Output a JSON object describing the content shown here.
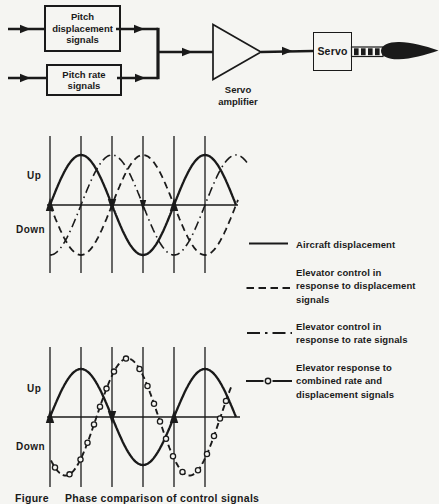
{
  "figure": {
    "colors": {
      "ink": "#1a1a1a",
      "paper": "#f5f5f2"
    },
    "block_diagram": {
      "displacement_box": "Pitch\ndisplacement\nsignals",
      "rate_box": "Pitch rate\nsignals",
      "amplifier_label": "Servo\namplifier",
      "servo_box": "Servo"
    },
    "upper_plot": {
      "up_label": "Up",
      "down_label": "Down"
    },
    "lower_plot": {
      "up_label": "Up",
      "down_label": "Down"
    },
    "legend": {
      "items": [
        {
          "style": "solid",
          "label": "Aircraft displacement"
        },
        {
          "style": "dashed",
          "label": "Elevator control in\nresponse to displacement\nsignals"
        },
        {
          "style": "dash-dot",
          "label": "Elevator control in\nresponse to rate signals"
        },
        {
          "style": "circle-dashed",
          "label": "Elevator response to\ncombined rate and\ndisplacement signals"
        }
      ]
    },
    "caption_fragment": "Figure     Phase comparison of control signals"
  },
  "chart_data": [
    {
      "type": "line",
      "title": "Upper waveform plot: aircraft displacement and elevator control signals vs time",
      "xlabel": "time (no scale shown)",
      "ylabel": "Up / Down",
      "y_tick_labels": [
        "Up",
        "Down"
      ],
      "gridlines": {
        "vertical_count": 6,
        "spacing": "quarter period",
        "horizontal": false
      },
      "x_range_cycles": [
        0,
        1.5
      ],
      "series": [
        {
          "name": "Aircraft displacement",
          "line_style": "solid",
          "waveform": "sine",
          "amplitude": 1.0,
          "phase_deg": 0
        },
        {
          "name": "Elevator control in response to displacement signals",
          "line_style": "dashed",
          "waveform": "sine",
          "amplitude": 1.0,
          "phase_deg": 180
        },
        {
          "name": "Elevator control in response to rate signals",
          "line_style": "dash-dot",
          "waveform": "sine",
          "amplitude": 1.0,
          "phase_deg": -90
        }
      ]
    },
    {
      "type": "line",
      "title": "Lower waveform plot: aircraft displacement and combined elevator response vs time",
      "xlabel": "time (no scale shown)",
      "ylabel": "Up / Down",
      "y_tick_labels": [
        "Up",
        "Down"
      ],
      "gridlines": {
        "vertical_count": 6,
        "spacing": "quarter period",
        "horizontal": false
      },
      "x_range_cycles": [
        0,
        1.5
      ],
      "series": [
        {
          "name": "Aircraft displacement",
          "line_style": "solid",
          "waveform": "sine",
          "amplitude": 1.0,
          "phase_deg": 0
        },
        {
          "name": "Elevator response to combined rate and displacement signals",
          "line_style": "circle-dashed",
          "waveform": "sine",
          "amplitude": 1.22,
          "phase_deg": -135
        }
      ]
    }
  ]
}
